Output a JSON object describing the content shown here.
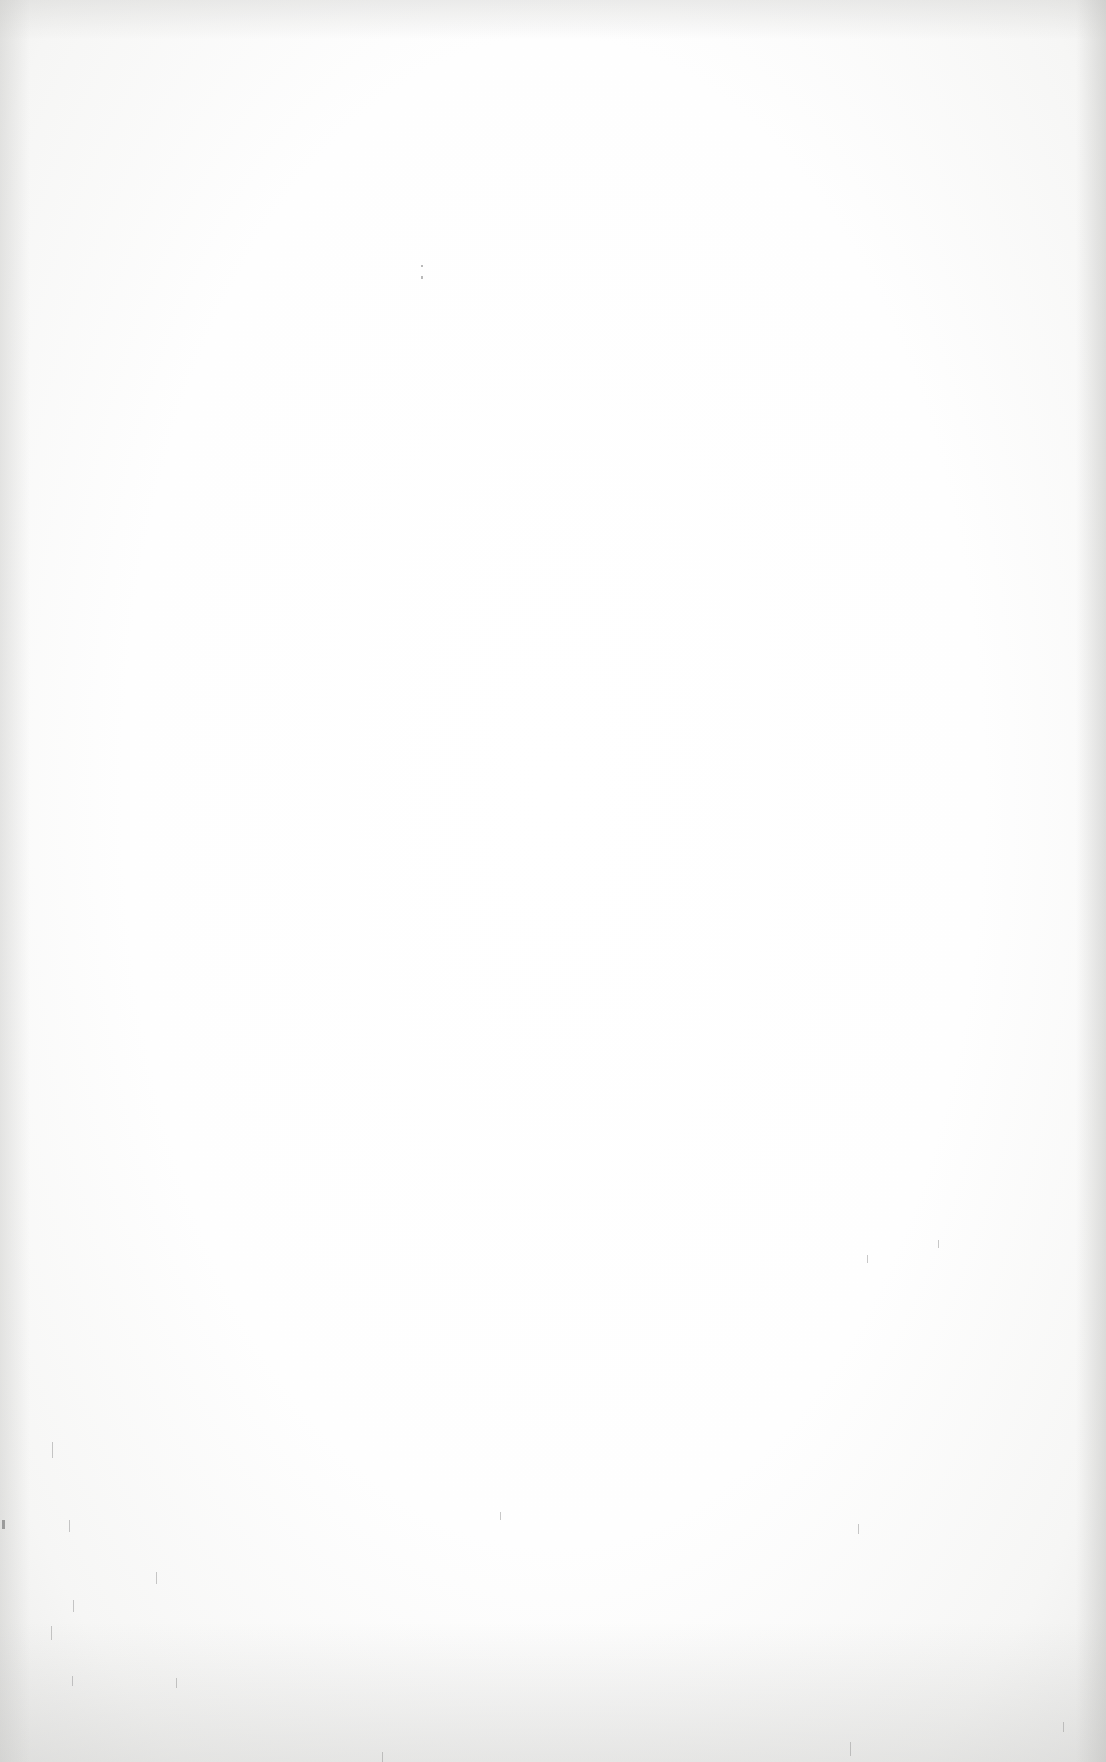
{
  "document": {
    "type": "scanned-blank-page",
    "text": ""
  },
  "colors": {
    "paper": "#fefefe",
    "edge_shadow": "#e6e6e4",
    "speck": "#8a8a8a"
  }
}
